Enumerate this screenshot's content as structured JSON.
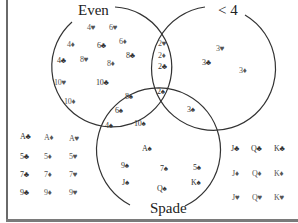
{
  "diagram": {
    "type": "venn",
    "sets": [
      {
        "name": "Even",
        "label": "Even"
      },
      {
        "name": "LessThan4",
        "label": "< 4"
      },
      {
        "name": "Spade",
        "label": "Spade"
      }
    ],
    "regions": {
      "even_only": [
        "4♥",
        "6♥",
        "4♦",
        "6♣",
        "6♦",
        "4♣",
        "8♥",
        "8♣",
        "8♦",
        "10♥",
        "10♣",
        "10♦"
      ],
      "even_and_lt4": [
        "2♥",
        "2♦",
        "2♣"
      ],
      "even_lt4_spade": [
        "2♠"
      ],
      "lt4_only": [
        "3♥",
        "3♣",
        "3♦"
      ],
      "lt4_and_spade": [
        "3♠"
      ],
      "even_and_spade": [
        "8♠",
        "6♠",
        "4♠",
        "10♠"
      ],
      "spade_only": [
        "A♠",
        "9♠",
        "7♠",
        "5♠",
        "J♠",
        "Q♠",
        "K♠"
      ],
      "outside_left": [
        "A♣",
        "A♦",
        "A♥",
        "5♣",
        "5♦",
        "5♥",
        "7♣",
        "7♦",
        "7♥",
        "9♣",
        "9♦",
        "9♥"
      ],
      "outside_right": [
        "J♣",
        "Q♣",
        "K♣",
        "J♦",
        "Q♦",
        "K♦",
        "J♥",
        "Q♥",
        "K♥"
      ]
    }
  },
  "labels": {
    "even": "Even",
    "lt4": "< 4",
    "spade": "Spade"
  },
  "cards": [
    {
      "t": "4♥",
      "x": 87,
      "y": 24
    },
    {
      "t": "6♥",
      "x": 109,
      "y": 24
    },
    {
      "t": "4♦",
      "x": 67,
      "y": 41
    },
    {
      "t": "6♣",
      "x": 97,
      "y": 42
    },
    {
      "t": "6♦",
      "x": 119,
      "y": 38
    },
    {
      "t": "4♣",
      "x": 57,
      "y": 57
    },
    {
      "t": "8♥",
      "x": 80,
      "y": 56
    },
    {
      "t": "8♦",
      "x": 107,
      "y": 60
    },
    {
      "t": "8♣",
      "x": 126,
      "y": 52
    },
    {
      "t": "10♥",
      "x": 54,
      "y": 79
    },
    {
      "t": "10♣",
      "x": 96,
      "y": 79
    },
    {
      "t": "10♦",
      "x": 64,
      "y": 98
    },
    {
      "t": "2♥",
      "x": 158,
      "y": 40
    },
    {
      "t": "2♦",
      "x": 158,
      "y": 52
    },
    {
      "t": "2♣",
      "x": 158,
      "y": 63
    },
    {
      "t": "2♠",
      "x": 157,
      "y": 88
    },
    {
      "t": "3♥",
      "x": 216,
      "y": 45
    },
    {
      "t": "3♣",
      "x": 202,
      "y": 59
    },
    {
      "t": "3♦",
      "x": 239,
      "y": 67
    },
    {
      "t": "3♠",
      "x": 187,
      "y": 106
    },
    {
      "t": "8♠",
      "x": 125,
      "y": 93
    },
    {
      "t": "6♠",
      "x": 115,
      "y": 107
    },
    {
      "t": "4♠",
      "x": 105,
      "y": 122
    },
    {
      "t": "10♠",
      "x": 134,
      "y": 120
    },
    {
      "t": "A♠",
      "x": 142,
      "y": 145
    },
    {
      "t": "9♠",
      "x": 121,
      "y": 162
    },
    {
      "t": "7♠",
      "x": 160,
      "y": 165
    },
    {
      "t": "5♠",
      "x": 193,
      "y": 164
    },
    {
      "t": "J♠",
      "x": 122,
      "y": 179
    },
    {
      "t": "Q♠",
      "x": 157,
      "y": 185
    },
    {
      "t": "K♠",
      "x": 191,
      "y": 179
    },
    {
      "t": "A♣",
      "x": 20,
      "y": 133
    },
    {
      "t": "A♦",
      "x": 44,
      "y": 134
    },
    {
      "t": "A♥",
      "x": 69,
      "y": 135
    },
    {
      "t": "5♣",
      "x": 20,
      "y": 153
    },
    {
      "t": "5♦",
      "x": 44,
      "y": 153
    },
    {
      "t": "5♥",
      "x": 69,
      "y": 153
    },
    {
      "t": "7♣",
      "x": 20,
      "y": 171
    },
    {
      "t": "7♦",
      "x": 44,
      "y": 171
    },
    {
      "t": "7♥",
      "x": 69,
      "y": 171
    },
    {
      "t": "9♣",
      "x": 20,
      "y": 189
    },
    {
      "t": "9♦",
      "x": 44,
      "y": 189
    },
    {
      "t": "9♥",
      "x": 69,
      "y": 189
    },
    {
      "t": "J♣",
      "x": 231,
      "y": 145
    },
    {
      "t": "Q♣",
      "x": 251,
      "y": 145
    },
    {
      "t": "K♣",
      "x": 274,
      "y": 145
    },
    {
      "t": "J♦",
      "x": 232,
      "y": 170
    },
    {
      "t": "Q♦",
      "x": 252,
      "y": 170
    },
    {
      "t": "K♦",
      "x": 274,
      "y": 170
    },
    {
      "t": "J♥",
      "x": 232,
      "y": 194
    },
    {
      "t": "Q♥",
      "x": 252,
      "y": 194
    },
    {
      "t": "K♥",
      "x": 274,
      "y": 194
    }
  ]
}
